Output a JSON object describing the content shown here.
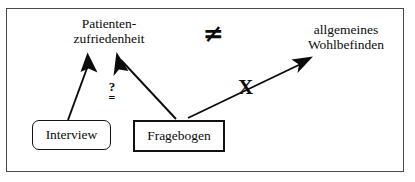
{
  "figure": {
    "title_visible": false,
    "frame": {
      "border_color": "#4a4a4a"
    },
    "background": "#ffffff",
    "ink_color": "#0b0b0b"
  },
  "nodes": [
    {
      "id": "patientenzufriedenheit",
      "line1": "Patienten-",
      "line2": "zufriedenheit",
      "shape": "text"
    },
    {
      "id": "wohlbefinden",
      "line1": "allgemeines",
      "line2": "Wohlbefinden",
      "shape": "text"
    },
    {
      "id": "interview",
      "label": "Interview",
      "shape": "rounded-box"
    },
    {
      "id": "fragebogen",
      "label": "Fragebogen",
      "shape": "rectangle-box"
    }
  ],
  "symbols": {
    "not_equal": "≠",
    "cross_out": "X",
    "questioned_equal_question": "?",
    "questioned_equal_equals": "="
  },
  "arrows": [
    {
      "id": "interview-to-patientenzufriedenheit",
      "from": "interview",
      "to": "patientenzufriedenheit",
      "style": "solid-filled-arrowhead"
    },
    {
      "id": "fragebogen-to-patientenzufriedenheit",
      "from": "fragebogen",
      "to": "patientenzufriedenheit",
      "style": "solid-filled-arrowhead"
    },
    {
      "id": "fragebogen-to-wohlbefinden",
      "from": "fragebogen",
      "to": "wohlbefinden",
      "style": "solid-filled-arrowhead-crossed-out"
    }
  ]
}
